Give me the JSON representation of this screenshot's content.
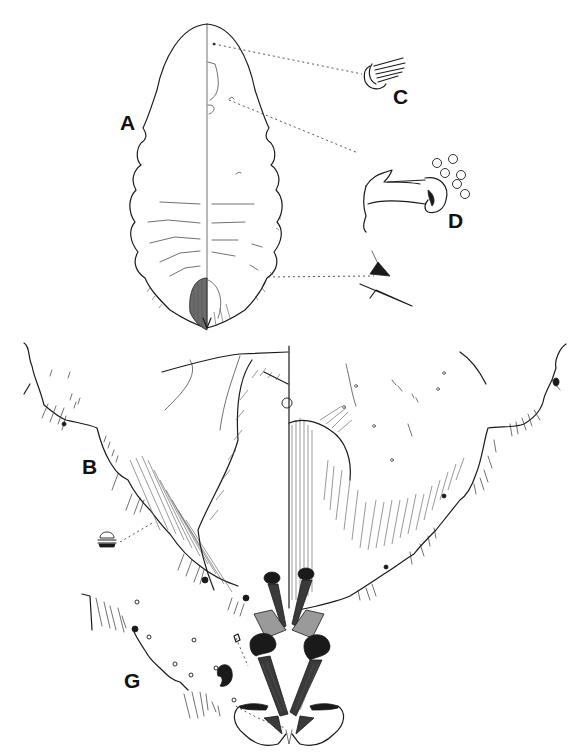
{
  "figure": {
    "panel_labels": {
      "A": "A",
      "B": "B",
      "C": "C",
      "D": "D",
      "G": "G"
    },
    "colors": {
      "ink": "#1a1a1a",
      "background": "#ffffff"
    }
  }
}
